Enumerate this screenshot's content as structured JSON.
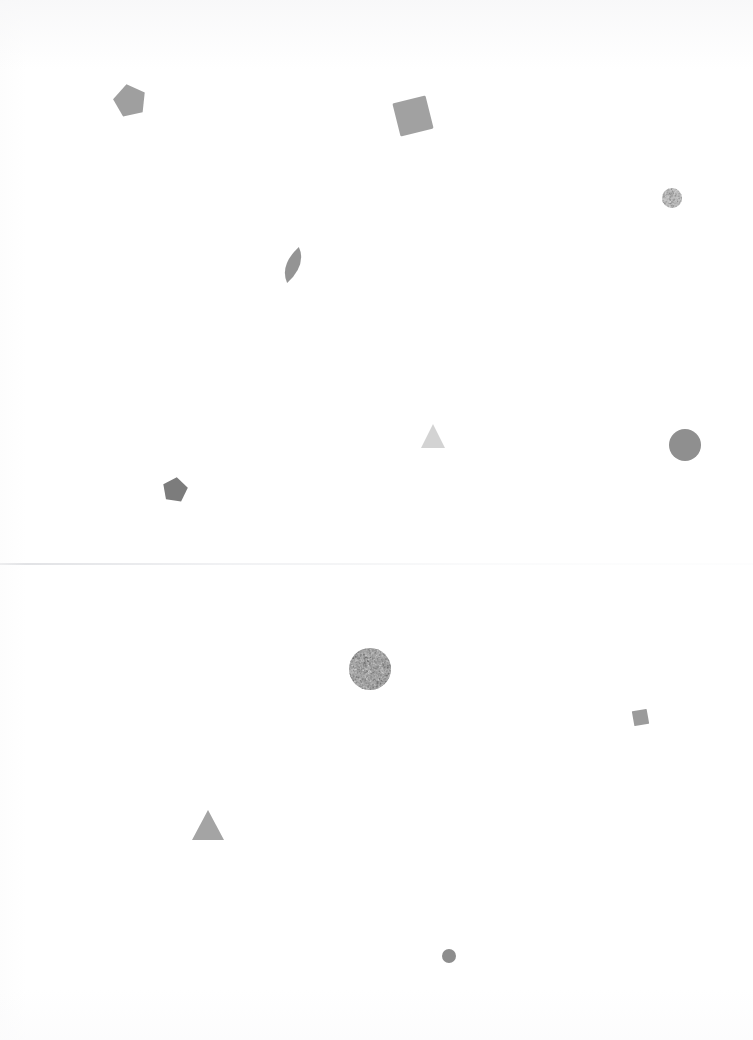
{
  "page": {
    "background_color": "#ffffff",
    "width": 753,
    "height": 1040
  },
  "fold_line": {
    "label": "horizontal scan fold line",
    "y": 563,
    "color": "#e2e3e6"
  },
  "shapes": [
    {
      "id": "pentagon-top-left",
      "type": "pentagon",
      "label": "grey pentagon",
      "x": 113,
      "y": 84,
      "width": 34,
      "height": 34,
      "rotation": -12,
      "fill": "#9a9a9a",
      "opacity": 0.95
    },
    {
      "id": "square-top-center",
      "type": "square",
      "label": "grey rotated square",
      "x": 396,
      "y": 99,
      "width": 34,
      "height": 34,
      "rotation": -14,
      "fill": "#9c9c9c",
      "opacity": 0.95
    },
    {
      "id": "circle-small-top-right",
      "type": "circle",
      "label": "small light grey textured circle",
      "x": 662,
      "y": 188,
      "width": 20,
      "height": 20,
      "rotation": 0,
      "fill": "#bdbdbd",
      "opacity": 0.9,
      "textured": true
    },
    {
      "id": "leaf-upper-center",
      "type": "leaf",
      "label": "grey leaf shape",
      "x": 280,
      "y": 246,
      "width": 26,
      "height": 38,
      "rotation": 18,
      "fill": "#8e8e8e",
      "opacity": 0.95
    },
    {
      "id": "triangle-small-center",
      "type": "triangle",
      "label": "very light grey small triangle",
      "x": 421,
      "y": 424,
      "width": 24,
      "height": 24,
      "rotation": 0,
      "fill": "#cfcfcf",
      "opacity": 0.9
    },
    {
      "id": "circle-large-right",
      "type": "circle",
      "label": "large grey circle",
      "x": 669,
      "y": 429,
      "width": 32,
      "height": 32,
      "rotation": 0,
      "fill": "#8f8f8f",
      "opacity": 1
    },
    {
      "id": "pentagon-mid-left",
      "type": "pentagon",
      "label": "small dark grey pentagon",
      "x": 162,
      "y": 477,
      "width": 26,
      "height": 26,
      "rotation": 8,
      "fill": "#7c7c7c",
      "opacity": 1
    },
    {
      "id": "circle-textured-center",
      "type": "circle",
      "label": "mottled grainy grey circle",
      "x": 349,
      "y": 648,
      "width": 42,
      "height": 42,
      "rotation": 0,
      "fill": "#a5a5a5",
      "opacity": 1,
      "textured": true
    },
    {
      "id": "square-small-right",
      "type": "square",
      "label": "small grey square",
      "x": 633,
      "y": 710,
      "width": 15,
      "height": 15,
      "rotation": -10,
      "fill": "#969696",
      "opacity": 0.95
    },
    {
      "id": "triangle-lower-left",
      "type": "triangle",
      "label": "grey triangle",
      "x": 192,
      "y": 810,
      "width": 32,
      "height": 30,
      "rotation": 0,
      "fill": "#a0a0a0",
      "opacity": 0.95
    },
    {
      "id": "dot-bottom-center",
      "type": "circle",
      "label": "small grey dot",
      "x": 442,
      "y": 949,
      "width": 14,
      "height": 14,
      "rotation": 0,
      "fill": "#8d8d8d",
      "opacity": 1
    }
  ]
}
